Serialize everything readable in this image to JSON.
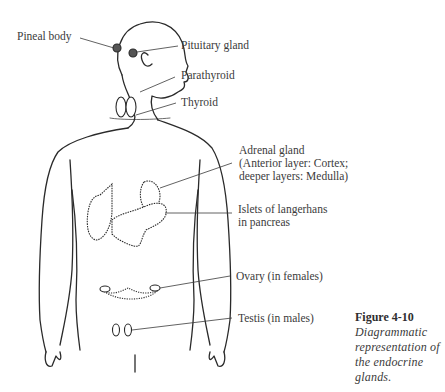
{
  "diagram": {
    "type": "anatomical-illustration",
    "labels": {
      "pineal": "Pineal body",
      "pituitary": "Pituitary gland",
      "parathyroid": "Parathyroid",
      "thyroid": "Thyroid",
      "adrenal_line1": "Adrenal gland",
      "adrenal_line2": "(Anterior layer:  Cortex;",
      "adrenal_line3": "deeper layers:  Medulla)",
      "islets_line1": "Islets of langerhans",
      "islets_line2": "in pancreas",
      "ovary": "Ovary (in females)",
      "testis": "Testis (in males)"
    },
    "caption": {
      "title": "Figure 4-10",
      "text": "Diagrammatic representation of the endocrine glands."
    },
    "colors": {
      "line": "#2a2a2a",
      "text": "#3b3b3b",
      "background": "#ffffff"
    }
  }
}
